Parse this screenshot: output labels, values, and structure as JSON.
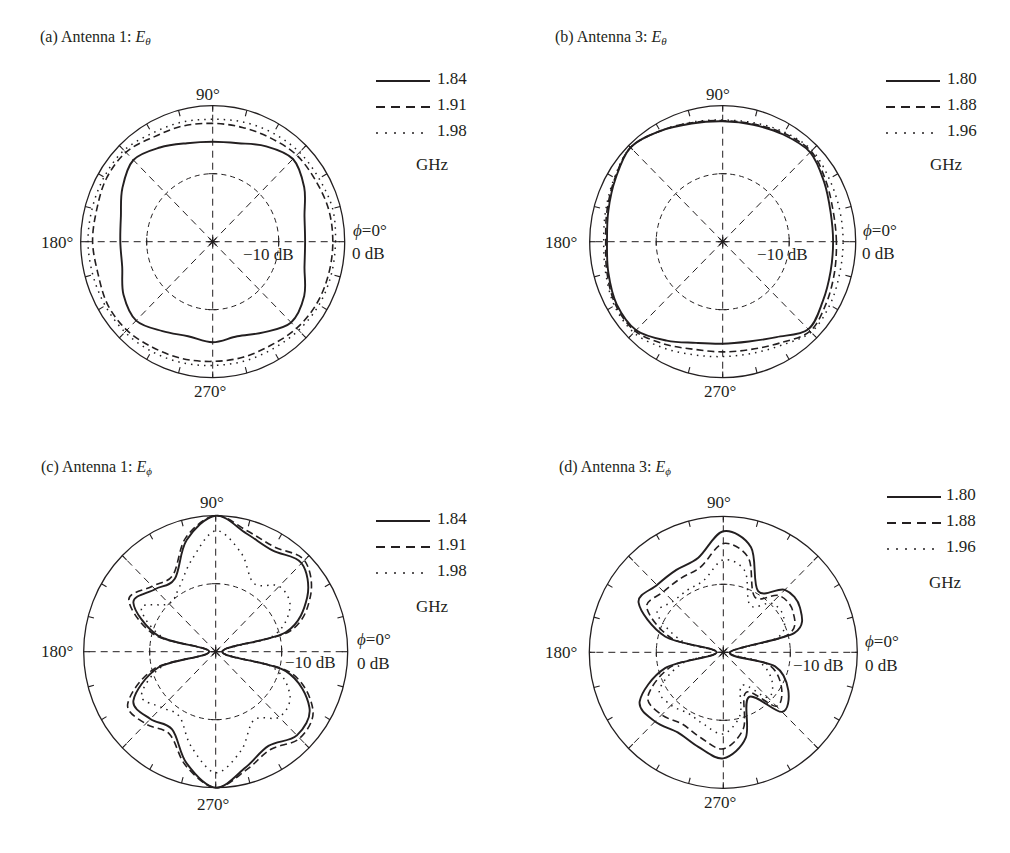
{
  "figure": {
    "background": "#ffffff",
    "ink": "#231f20"
  },
  "chart_data": [
    {
      "id": "a",
      "type": "polar-line",
      "title": {
        "prefix": "(a) Antenna 1: ",
        "symbol": "E",
        "subscript": "θ"
      },
      "angle_labels": {
        "top": "90°",
        "left": "180°",
        "bottom": "270°",
        "right_phi": "ϕ",
        "right_eq": "=0°"
      },
      "radial_labels": {
        "outer": "0 dB",
        "inner": "−10 dB"
      },
      "radial_range_db": [
        -20,
        0
      ],
      "radial_gridlines_db": [
        -10
      ],
      "angular_gridlines_deg": [
        0,
        45,
        90,
        135,
        180,
        225,
        270,
        315
      ],
      "tick_step_deg": 15,
      "legend_unit": "GHz",
      "angles_deg": [
        0,
        15,
        30,
        45,
        60,
        75,
        90,
        105,
        120,
        135,
        150,
        165,
        180,
        195,
        210,
        225,
        240,
        255,
        270,
        285,
        300,
        315,
        330,
        345
      ],
      "series": [
        {
          "name": "1.84",
          "style": "solid",
          "values_db": [
            -6.0,
            -5.6,
            -4.0,
            -2.8,
            -3.8,
            -5.0,
            -5.3,
            -5.0,
            -4.0,
            -3.0,
            -4.2,
            -5.6,
            -6.0,
            -5.8,
            -4.4,
            -3.6,
            -4.8,
            -5.6,
            -5.2,
            -5.6,
            -4.6,
            -3.2,
            -4.0,
            -5.6
          ]
        },
        {
          "name": "1.91",
          "style": "dashed",
          "values_db": [
            -1.8,
            -1.8,
            -2.0,
            -2.0,
            -2.4,
            -2.6,
            -2.6,
            -2.4,
            -2.2,
            -1.4,
            -1.4,
            -1.8,
            -1.8,
            -2.0,
            -1.6,
            -1.6,
            -2.0,
            -2.2,
            -2.4,
            -2.4,
            -2.4,
            -2.0,
            -1.8,
            -1.8
          ]
        },
        {
          "name": "1.98",
          "style": "dotted",
          "values_db": [
            -1.4,
            -1.2,
            -1.4,
            -1.4,
            -1.6,
            -1.8,
            -2.0,
            -1.8,
            -1.6,
            -1.0,
            -1.0,
            -1.1,
            -1.1,
            -1.2,
            -1.2,
            -1.2,
            -1.4,
            -1.6,
            -1.8,
            -1.8,
            -1.8,
            -1.6,
            -1.4,
            -1.4
          ]
        }
      ]
    },
    {
      "id": "b",
      "type": "polar-line",
      "title": {
        "prefix": "(b) Antenna 3: ",
        "symbol": "E",
        "subscript": "θ"
      },
      "angle_labels": {
        "top": "90°",
        "left": "180°",
        "bottom": "270°",
        "right_phi": "ϕ",
        "right_eq": "=0°"
      },
      "radial_labels": {
        "outer": "0 dB",
        "inner": "−10 dB"
      },
      "radial_range_db": [
        -20,
        0
      ],
      "radial_gridlines_db": [
        -10
      ],
      "angular_gridlines_deg": [
        0,
        45,
        90,
        135,
        180,
        225,
        270,
        315
      ],
      "tick_step_deg": 15,
      "legend_unit": "GHz",
      "angles_deg": [
        0,
        15,
        30,
        45,
        60,
        75,
        90,
        105,
        120,
        135,
        150,
        165,
        180,
        195,
        210,
        225,
        240,
        255,
        270,
        285,
        300,
        315,
        330,
        345
      ],
      "series": [
        {
          "name": "1.80",
          "style": "solid",
          "values_db": [
            -3.4,
            -3.2,
            -2.4,
            -1.4,
            -1.8,
            -2.2,
            -2.3,
            -2.0,
            -1.2,
            -0.4,
            -1.4,
            -2.2,
            -2.6,
            -2.2,
            -1.6,
            -1.6,
            -3.2,
            -4.6,
            -5.0,
            -4.8,
            -3.8,
            -1.8,
            -2.6,
            -3.2
          ]
        },
        {
          "name": "1.88",
          "style": "dashed",
          "values_db": [
            -2.9,
            -2.8,
            -2.1,
            -1.2,
            -1.6,
            -2.1,
            -2.2,
            -1.9,
            -1.2,
            -0.4,
            -1.3,
            -2.0,
            -2.4,
            -2.0,
            -1.4,
            -1.4,
            -2.6,
            -3.6,
            -3.8,
            -3.6,
            -2.8,
            -1.4,
            -2.0,
            -2.6
          ]
        },
        {
          "name": "1.96",
          "style": "dotted",
          "values_db": [
            -1.9,
            -1.8,
            -1.5,
            -1.0,
            -1.4,
            -1.9,
            -2.1,
            -1.8,
            -1.2,
            -0.4,
            -1.2,
            -1.8,
            -2.1,
            -1.8,
            -1.2,
            -1.1,
            -2.0,
            -2.8,
            -3.1,
            -3.0,
            -2.4,
            -1.2,
            -1.4,
            -1.8
          ]
        }
      ]
    },
    {
      "id": "c",
      "type": "polar-line",
      "title": {
        "prefix": "(c) Antenna 1: ",
        "symbol": "E",
        "subscript": "ϕ"
      },
      "angle_labels": {
        "top": "90°",
        "left": "180°",
        "bottom": "270°",
        "right_phi": "ϕ",
        "right_eq": "=0°"
      },
      "radial_labels": {
        "outer": "0 dB",
        "inner": "−10 dB"
      },
      "radial_range_db": [
        -20,
        0
      ],
      "radial_gridlines_db": [
        -10
      ],
      "angular_gridlines_deg": [
        0,
        45,
        90,
        135,
        180,
        225,
        270,
        315
      ],
      "tick_step_deg": 15,
      "legend_unit": "GHz",
      "angles_deg": [
        0,
        15,
        30,
        45,
        60,
        75,
        90,
        105,
        120,
        135,
        150,
        165,
        180,
        195,
        210,
        225,
        240,
        255,
        270,
        285,
        300,
        315,
        330,
        345
      ],
      "series": [
        {
          "name": "1.84",
          "style": "solid",
          "values_db": [
            -19.0,
            -9.0,
            -4.0,
            -1.6,
            -2.8,
            -2.0,
            0.0,
            -3.0,
            -7.6,
            -7.0,
            -5.6,
            -11.0,
            -19.0,
            -11.0,
            -5.6,
            -6.0,
            -6.8,
            -3.0,
            0.0,
            -2.4,
            -4.0,
            -2.6,
            -3.6,
            -9.0
          ]
        },
        {
          "name": "1.91",
          "style": "dashed",
          "values_db": [
            -19.0,
            -8.4,
            -3.4,
            -1.0,
            -2.2,
            -1.6,
            0.0,
            -2.6,
            -7.0,
            -6.4,
            -4.8,
            -10.4,
            -19.0,
            -10.4,
            -4.6,
            -5.0,
            -6.0,
            -2.6,
            0.0,
            -2.0,
            -3.4,
            -2.0,
            -3.0,
            -8.4
          ]
        },
        {
          "name": "1.98",
          "style": "dotted",
          "values_db": [
            -19.0,
            -11.0,
            -7.0,
            -6.4,
            -8.4,
            -5.0,
            -2.2,
            -6.0,
            -9.0,
            -10.0,
            -7.0,
            -11.6,
            -19.0,
            -11.6,
            -7.0,
            -8.4,
            -9.0,
            -5.6,
            -2.2,
            -5.0,
            -8.4,
            -6.4,
            -7.0,
            -11.0
          ]
        }
      ]
    },
    {
      "id": "d",
      "type": "polar-line",
      "title": {
        "prefix": "(d) Antenna 3: ",
        "symbol": "E",
        "subscript": "ϕ"
      },
      "angle_labels": {
        "top": "90°",
        "left": "180°",
        "bottom": "270°",
        "right_phi": "ϕ",
        "right_eq": "=0°"
      },
      "radial_labels": {
        "outer": "0 dB",
        "inner": "−10 dB"
      },
      "radial_range_db": [
        -20,
        0
      ],
      "radial_gridlines_db": [
        -10
      ],
      "angular_gridlines_deg": [
        0,
        45,
        90,
        135,
        180,
        225,
        270,
        315
      ],
      "tick_step_deg": 15,
      "legend_unit": "GHz",
      "angles_deg": [
        0,
        15,
        30,
        45,
        60,
        75,
        90,
        105,
        120,
        135,
        150,
        165,
        180,
        195,
        210,
        225,
        240,
        255,
        270,
        285,
        300,
        315,
        330,
        345
      ],
      "series": [
        {
          "name": "1.80",
          "style": "solid",
          "values_db": [
            -19.0,
            -9.0,
            -6.8,
            -7.0,
            -9.6,
            -4.0,
            -2.2,
            -5.6,
            -6.0,
            -6.0,
            -5.4,
            -11.0,
            -19.0,
            -11.0,
            -5.6,
            -5.6,
            -6.4,
            -5.6,
            -4.4,
            -7.0,
            -12.4,
            -7.6,
            -8.8,
            -12.0
          ]
        },
        {
          "name": "1.88",
          "style": "dashed",
          "values_db": [
            -19.0,
            -10.0,
            -8.0,
            -8.2,
            -10.6,
            -5.6,
            -4.0,
            -7.0,
            -7.4,
            -7.4,
            -6.8,
            -12.0,
            -19.0,
            -12.0,
            -7.0,
            -7.0,
            -7.8,
            -7.0,
            -5.8,
            -8.4,
            -13.2,
            -8.8,
            -10.0,
            -13.0
          ]
        },
        {
          "name": "1.96",
          "style": "dotted",
          "values_db": [
            -19.0,
            -11.6,
            -9.6,
            -9.8,
            -12.0,
            -7.6,
            -6.4,
            -9.0,
            -9.4,
            -9.4,
            -8.6,
            -13.6,
            -19.0,
            -13.6,
            -9.0,
            -9.0,
            -9.6,
            -9.0,
            -8.0,
            -10.4,
            -14.4,
            -10.6,
            -11.6,
            -14.4
          ]
        }
      ]
    }
  ]
}
